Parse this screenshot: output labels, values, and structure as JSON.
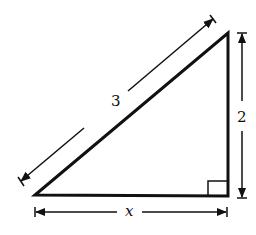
{
  "diagram": {
    "type": "right-triangle",
    "hypotenuse_label": "3",
    "vertical_leg_label": "2",
    "horizontal_leg_label": "x",
    "colors": {
      "stroke": "#111111",
      "background": "#ffffff"
    }
  }
}
